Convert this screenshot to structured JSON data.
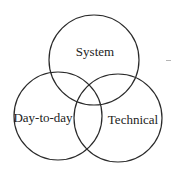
{
  "diagram": {
    "type": "venn",
    "stroke_color": "#2a2a2a",
    "text_color": "#222222",
    "background": "#ffffff",
    "sets": [
      {
        "id": "system",
        "label": "System",
        "cx": 94,
        "cy": 60,
        "r": 45,
        "label_x": 95,
        "label_y": 51
      },
      {
        "id": "day-to-day",
        "label": "Day-to-day",
        "cx": 58,
        "cy": 116,
        "r": 44,
        "label_x": 43,
        "label_y": 117
      },
      {
        "id": "technical",
        "label": "Technical",
        "cx": 118,
        "cy": 118,
        "r": 44,
        "label_x": 133,
        "label_y": 119
      }
    ]
  }
}
